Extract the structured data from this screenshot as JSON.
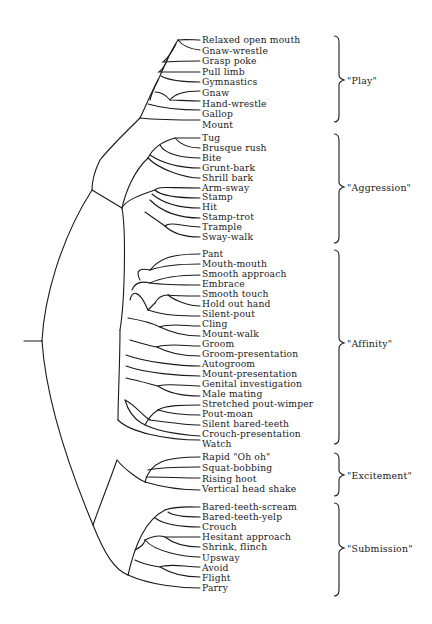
{
  "diagram": {
    "type": "dendrogram",
    "orientation": "left-to-right",
    "line_color": "#1a1a1a",
    "groups": [
      {
        "label": "\"Play\"",
        "leaves": [
          "Relaxed open mouth",
          "Gnaw-wrestle",
          "Grasp poke",
          "Pull limb",
          "Gymnastics",
          "Gnaw",
          "Hand-wrestle",
          "Gallop",
          "Mount"
        ]
      },
      {
        "label": "\"Aggression\"",
        "leaves": [
          "Tug",
          "Brusque rush",
          "Bite",
          "Grunt-bark",
          "Shrill bark",
          "Arm-sway",
          "Stamp",
          "Hit",
          "Stamp-trot",
          "Trample",
          "Sway-walk"
        ]
      },
      {
        "label": "\"Affinity\"",
        "leaves": [
          "Pant",
          "Mouth-mouth",
          "Smooth approach",
          "Embrace",
          "Smooth touch",
          "Hold out hand",
          "Silent-pout",
          "Cling",
          "Mount-walk",
          "Groom",
          "Groom-presentation",
          "Autogroom",
          "Mount-presentation",
          "Genital investigation",
          "Male mating",
          "Stretched pout-wimper",
          "Pout-moan",
          "Silent bared-teeth",
          "Crouch-presentation",
          "Watch"
        ]
      },
      {
        "label": "\"Excitement\"",
        "leaves": [
          "Rapid \"Oh oh\"",
          "Squat-bobbing",
          "Rising hoot",
          "Vertical head shake"
        ]
      },
      {
        "label": "\"Submission\"",
        "leaves": [
          "Bared-teeth-scream",
          "Bared-teeth-yelp",
          "Crouch",
          "Hesitant approach",
          "Shrink, flinch",
          "Upsway",
          "Avoid",
          "Flight",
          "Parry"
        ]
      }
    ]
  }
}
